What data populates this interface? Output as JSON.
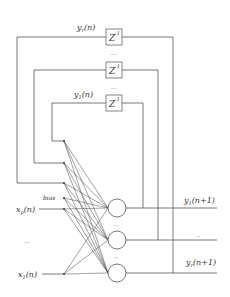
{
  "diagram": {
    "type": "recurrent-neural-network",
    "delay_blocks": [
      {
        "label": "Z",
        "superscript": "-1",
        "feedback": "y_r(n)"
      },
      {
        "label": "Z",
        "superscript": "-1",
        "feedback": "..."
      },
      {
        "label": "Z",
        "superscript": "-1",
        "feedback": "y_1(n)"
      }
    ],
    "feedback_labels": {
      "top": {
        "base": "y",
        "sub": "r",
        "arg": "(n)"
      },
      "bottom": {
        "base": "y",
        "sub": "1",
        "arg": "(n)"
      }
    },
    "between_delays_dots": "....",
    "inputs": [
      {
        "base": "x",
        "sub": "p",
        "arg": "(n)"
      },
      {
        "label": "..."
      },
      {
        "base": "x",
        "sub": "1",
        "arg": "(n)"
      }
    ],
    "bias_label": "bias",
    "neuron_dots": "...",
    "outputs": [
      {
        "base": "y",
        "sub": "1",
        "arg": "(n+1)"
      },
      {
        "label": "..."
      },
      {
        "base": "y",
        "sub": "r",
        "arg": "(n+1)"
      }
    ]
  },
  "labels": {
    "yr_n_base": "y",
    "yr_n_sub": "r",
    "yr_n_arg": "(n)",
    "y1_n_base": "y",
    "y1_n_sub": "1",
    "y1_n_arg": "(n)",
    "z": "Z",
    "z_exp": "-1",
    "dots4": "....",
    "dots3": "...",
    "bias": "bias",
    "xp_base": "x",
    "xp_sub": "p",
    "xp_arg": "(n)",
    "x1_base": "x",
    "x1_sub": "1",
    "x1_arg": "(n)",
    "y1_out_base": "y",
    "y1_out_sub": "1",
    "y1_out_arg": "(n+1)",
    "yr_out_base": "y",
    "yr_out_sub": "r",
    "yr_out_arg": "(n+1)"
  }
}
